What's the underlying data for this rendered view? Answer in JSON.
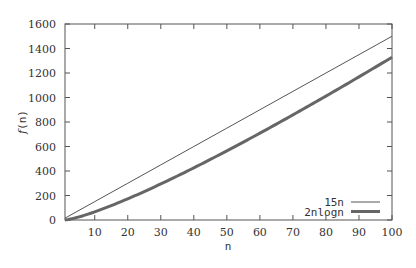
{
  "chart_data": {
    "type": "line",
    "title": "",
    "xlabel": "n",
    "ylabel": "f(n)",
    "xlim": [
      1,
      100
    ],
    "ylim": [
      0,
      1600
    ],
    "xticks": [
      10,
      20,
      30,
      40,
      50,
      60,
      70,
      80,
      90,
      100
    ],
    "yticks": [
      0,
      200,
      400,
      600,
      800,
      1000,
      1200,
      1400,
      1600
    ],
    "grid": false,
    "legend_position": "lower right",
    "x": [
      1,
      10,
      20,
      30,
      40,
      50,
      60,
      70,
      80,
      90,
      100
    ],
    "series": [
      {
        "name": "15n",
        "color": "#555555",
        "line_width": 1,
        "values": [
          15,
          150,
          300,
          450,
          600,
          750,
          900,
          1050,
          1200,
          1350,
          1500
        ]
      },
      {
        "name": "2nlogn",
        "color": "#666666",
        "line_width": 3,
        "values": [
          0,
          66.4,
          172.9,
          294.4,
          425.8,
          564.4,
          708.8,
          858.0,
          1011.5,
          1168.5,
          1328.8
        ]
      }
    ]
  }
}
